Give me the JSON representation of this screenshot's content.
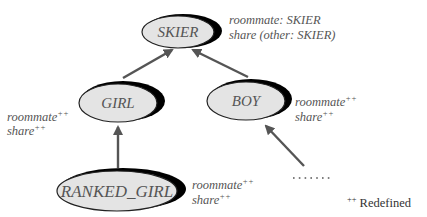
{
  "diagram": {
    "type": "inheritance-hierarchy",
    "colors": {
      "node_fill": "#e4e4e4",
      "node_stroke": "#222222",
      "shadow": "#000000",
      "arrow": "#555555",
      "text": "#555555"
    },
    "nodes": [
      {
        "id": "skier",
        "label": "SKIER",
        "features": [
          "roommate: SKIER",
          "share (other: SKIER)"
        ]
      },
      {
        "id": "girl",
        "label": "GIRL",
        "features": [
          "roommate",
          "share"
        ],
        "redefined": true
      },
      {
        "id": "boy",
        "label": "BOY",
        "features": [
          "roommate",
          "share"
        ],
        "redefined": true
      },
      {
        "id": "ranked_girl",
        "label": "RANKED_GIRL",
        "features": [
          "roommate",
          "share"
        ],
        "redefined": true
      }
    ],
    "edges": [
      {
        "from": "girl",
        "to": "skier"
      },
      {
        "from": "boy",
        "to": "skier"
      },
      {
        "from": "ranked_girl",
        "to": "girl"
      },
      {
        "from": "unnamed-descendant",
        "to": "boy"
      }
    ],
    "markers": {
      "redefined": "++",
      "ellipsis": "......."
    },
    "legend": {
      "marker": "++",
      "label": "Redefined"
    }
  }
}
